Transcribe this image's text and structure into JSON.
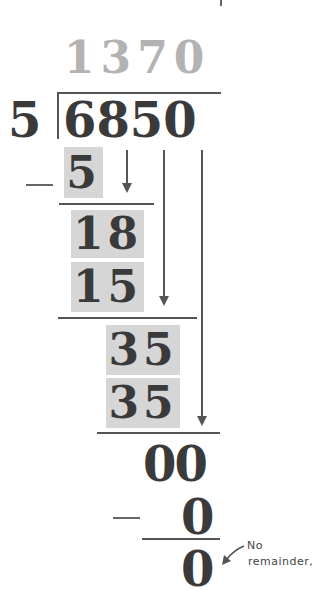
{
  "problem": {
    "description": "Long division: 6850 divided by 5",
    "divisor": "5",
    "dividend": "6850",
    "quotient": "1370"
  },
  "steps": [
    {
      "subtract": "5",
      "shaded": true
    },
    {
      "partial": "18",
      "shaded": true
    },
    {
      "subtract": "15",
      "shaded": true
    },
    {
      "partial": "35",
      "shaded": true
    },
    {
      "subtract": "35",
      "shaded": true
    },
    {
      "partial": "00",
      "shaded": false
    },
    {
      "subtract": "0",
      "shaded": false
    },
    {
      "remainder": "0",
      "shaded": false
    }
  ],
  "symbols": {
    "minus": "−"
  },
  "annotation": {
    "line1": "No",
    "line2": "remainder,"
  },
  "colors": {
    "digits": "#3a3a3a",
    "quotient": "#b3b3b3",
    "shading": "#d6d6d6",
    "lines": "#555555"
  },
  "icons": {
    "bring_down_arrows": [
      "arrow-down-icon",
      "arrow-down-icon",
      "arrow-down-icon"
    ],
    "annotation_arrow": "arrow-down-left-icon"
  }
}
